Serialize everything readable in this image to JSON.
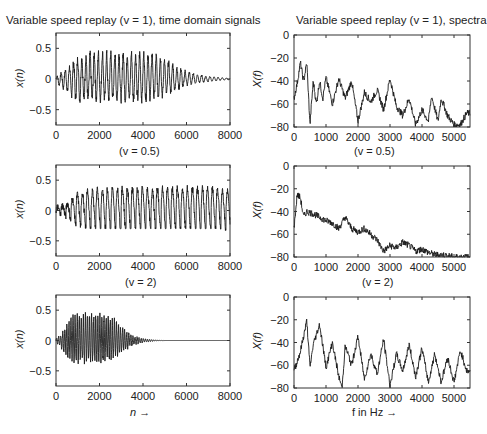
{
  "titles": {
    "left": "Variable speed replay (v = 1), time domain signals",
    "right": "Variable speed replay (v = 1), spectra"
  },
  "subtitles": {
    "row2": "(v = 0.5)",
    "row3": "(v = 2)"
  },
  "axis_labels": {
    "time_y": "x(n)",
    "spec_y": "X(f)",
    "time_x": "n →",
    "spec_x": "f in Hz →"
  },
  "chart_data": [
    {
      "type": "line",
      "title": "Variable speed replay (v = 1), time domain signals",
      "xlabel": "",
      "ylabel": "x(n)",
      "xlim": [
        0,
        8000
      ],
      "ylim": [
        -0.75,
        0.75
      ],
      "xticks": [
        0,
        2000,
        4000,
        6000,
        8000
      ],
      "yticks": [
        -0.5,
        0,
        0.5
      ],
      "description": "Oscillating signal with envelope peaking ~0.42 around n=2000-4000, decaying to ~0 by n=8000",
      "x": [
        0,
        500,
        1000,
        1500,
        2000,
        2500,
        3000,
        3500,
        4000,
        4500,
        5000,
        5500,
        6000,
        6500,
        7000,
        7500,
        8000
      ],
      "envelope_pos": [
        0.03,
        0.15,
        0.33,
        0.38,
        0.42,
        0.42,
        0.41,
        0.41,
        0.4,
        0.38,
        0.32,
        0.2,
        0.12,
        0.07,
        0.04,
        0.02,
        0.01
      ],
      "envelope_neg": [
        -0.05,
        -0.2,
        -0.33,
        -0.33,
        -0.32,
        -0.32,
        -0.32,
        -0.32,
        -0.32,
        -0.3,
        -0.25,
        -0.17,
        -0.1,
        -0.06,
        -0.04,
        -0.02,
        -0.01
      ]
    },
    {
      "type": "line",
      "title": "Variable speed replay (v = 1), spectra",
      "xlabel": "",
      "ylabel": "X(f)",
      "xlim": [
        0,
        5500
      ],
      "ylim": [
        -80,
        0
      ],
      "xticks": [
        0,
        1000,
        2000,
        3000,
        4000,
        5000
      ],
      "yticks": [
        -80,
        -60,
        -40,
        -20,
        0
      ],
      "x": [
        0,
        100,
        200,
        300,
        400,
        500,
        600,
        700,
        800,
        900,
        1000,
        1200,
        1400,
        1600,
        1800,
        2000,
        2200,
        2400,
        2600,
        2800,
        3000,
        3200,
        3400,
        3600,
        3800,
        4000,
        4200,
        4300,
        4500,
        4600,
        4800,
        5000,
        5200,
        5400
      ],
      "values": [
        -55,
        -42,
        -24,
        -40,
        -24,
        -78,
        -40,
        -60,
        -40,
        -55,
        -37,
        -60,
        -38,
        -55,
        -40,
        -75,
        -50,
        -58,
        -48,
        -65,
        -38,
        -62,
        -70,
        -55,
        -78,
        -65,
        -75,
        -53,
        -75,
        -55,
        -70,
        -78,
        -78,
        -68
      ]
    },
    {
      "type": "line",
      "title": "(v = 0.5)",
      "xlabel": "",
      "ylabel": "x(n)",
      "xlim": [
        0,
        8000
      ],
      "ylim": [
        -0.75,
        0.75
      ],
      "xticks": [
        0,
        2000,
        4000,
        6000,
        8000
      ],
      "yticks": [
        -0.5,
        0,
        0.5
      ],
      "description": "Periodic signal with ~18 cycles, peaks ~0.35-0.42, troughs ~-0.3",
      "x": [
        0,
        500,
        1000,
        1500,
        2000,
        2500,
        3000,
        3500,
        4000,
        4500,
        5000,
        5500,
        6000,
        6500,
        7000,
        7500,
        8000
      ],
      "envelope_pos": [
        0.05,
        0.12,
        0.3,
        0.35,
        0.38,
        0.4,
        0.4,
        0.4,
        0.4,
        0.4,
        0.4,
        0.4,
        0.4,
        0.4,
        0.4,
        0.38,
        0.35
      ],
      "envelope_neg": [
        -0.05,
        -0.15,
        -0.28,
        -0.3,
        -0.3,
        -0.3,
        -0.3,
        -0.3,
        -0.3,
        -0.3,
        -0.3,
        -0.3,
        -0.3,
        -0.3,
        -0.3,
        -0.3,
        -0.35
      ]
    },
    {
      "type": "line",
      "title": "(v = 0.5)",
      "xlabel": "",
      "ylabel": "X(f)",
      "xlim": [
        0,
        5500
      ],
      "ylim": [
        -80,
        0
      ],
      "xticks": [
        0,
        1000,
        2000,
        3000,
        4000,
        5000
      ],
      "yticks": [
        -80,
        -60,
        -40,
        -20,
        0
      ],
      "x": [
        0,
        100,
        200,
        300,
        400,
        600,
        800,
        1000,
        1200,
        1400,
        1600,
        1800,
        2000,
        2200,
        2400,
        2600,
        2800,
        3000,
        3200,
        3400,
        3600,
        3800,
        4000,
        4200,
        4400,
        4600,
        4800,
        5000
      ],
      "values": [
        -55,
        -25,
        -28,
        -45,
        -40,
        -42,
        -45,
        -48,
        -50,
        -55,
        -45,
        -55,
        -58,
        -55,
        -60,
        -65,
        -75,
        -70,
        -72,
        -67,
        -70,
        -75,
        -73,
        -76,
        -78,
        -78,
        -79,
        -80
      ]
    },
    {
      "type": "line",
      "title": "(v = 2)",
      "xlabel": "n →",
      "ylabel": "x(n)",
      "xlim": [
        0,
        8000
      ],
      "ylim": [
        -0.75,
        0.75
      ],
      "xticks": [
        0,
        2000,
        4000,
        6000,
        8000
      ],
      "yticks": [
        -0.5,
        0,
        0.5
      ],
      "description": "Compressed signal: envelope peaks ~0.4 around n=1000-2500, decays to 0 by ~4500, flat afterwards",
      "x": [
        0,
        250,
        500,
        750,
        1000,
        1500,
        2000,
        2500,
        3000,
        3500,
        4000,
        4500,
        5000,
        8000
      ],
      "envelope_pos": [
        0.03,
        0.1,
        0.3,
        0.35,
        0.4,
        0.4,
        0.4,
        0.38,
        0.2,
        0.08,
        0.03,
        0.01,
        0,
        0
      ],
      "envelope_neg": [
        -0.03,
        -0.12,
        -0.3,
        -0.32,
        -0.32,
        -0.32,
        -0.32,
        -0.3,
        -0.18,
        -0.08,
        -0.03,
        -0.01,
        0,
        0
      ]
    },
    {
      "type": "line",
      "title": "(v = 2)",
      "xlabel": "f in Hz →",
      "ylabel": "X(f)",
      "xlim": [
        0,
        5500
      ],
      "ylim": [
        -80,
        0
      ],
      "xticks": [
        0,
        1000,
        2000,
        3000,
        4000,
        5000
      ],
      "yticks": [
        -80,
        -60,
        -40,
        -20,
        0
      ],
      "x": [
        0,
        200,
        400,
        500,
        600,
        800,
        1000,
        1200,
        1400,
        1500,
        1600,
        1800,
        2000,
        2200,
        2400,
        2600,
        2800,
        3000,
        3200,
        3400,
        3600,
        3800,
        4000,
        4200,
        4400,
        4600,
        4800,
        5000,
        5200,
        5400
      ],
      "values": [
        -65,
        -48,
        -21,
        -62,
        -42,
        -24,
        -62,
        -40,
        -70,
        -80,
        -43,
        -60,
        -35,
        -72,
        -50,
        -68,
        -37,
        -78,
        -50,
        -65,
        -42,
        -70,
        -45,
        -75,
        -50,
        -75,
        -53,
        -75,
        -47,
        -65
      ]
    }
  ]
}
